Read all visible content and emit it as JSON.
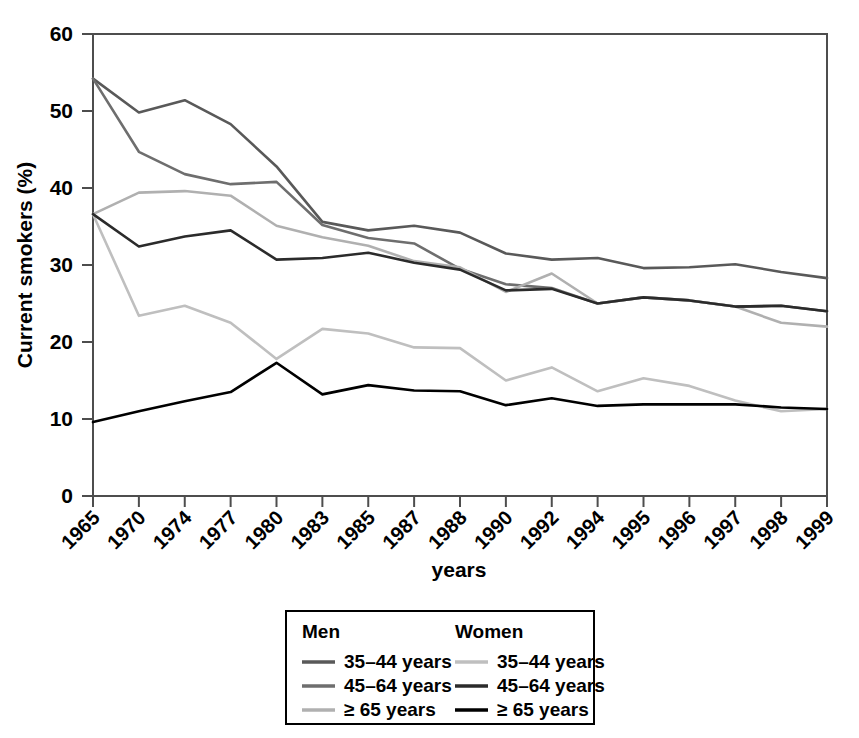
{
  "chart_data": {
    "type": "line",
    "title": "",
    "xlabel": "years",
    "ylabel": "Current smokers (%)",
    "ylim": [
      0,
      60
    ],
    "yticks": [
      0,
      10,
      20,
      30,
      40,
      50,
      60
    ],
    "ytick_labels": [
      "0",
      "10",
      "20",
      "30",
      "40",
      "50",
      "60"
    ],
    "grid": false,
    "legend_position": "below-center",
    "categories": [
      "1965",
      "1970",
      "1974",
      "1977",
      "1980",
      "1983",
      "1985",
      "1987",
      "1988",
      "1990",
      "1992",
      "1994",
      "1995",
      "1996",
      "1997",
      "1998",
      "1999"
    ],
    "series": [
      {
        "name": "Men 35–44 years",
        "group": "Men",
        "age": "35–44 years",
        "color": "#595959",
        "values": [
          54.2,
          49.8,
          51.4,
          48.3,
          42.8,
          35.6,
          34.5,
          35.1,
          34.2,
          31.5,
          30.7,
          30.9,
          29.6,
          29.7,
          30.1,
          29.1,
          28.3
        ]
      },
      {
        "name": "Men 45–64 years",
        "group": "Men",
        "age": "45–64 years",
        "color": "#6e6e6e",
        "values": [
          54.2,
          44.7,
          41.8,
          40.5,
          40.8,
          35.2,
          33.5,
          32.8,
          29.5,
          27.5,
          27.0,
          25.0,
          25.8,
          25.4,
          24.6,
          24.7,
          24.0
        ]
      },
      {
        "name": "Men ≥ 65 years",
        "group": "Men",
        "age": "≥ 65 years",
        "color": "#b0b0b0",
        "values": [
          36.6,
          39.4,
          39.6,
          39.0,
          35.1,
          33.6,
          32.5,
          30.5,
          29.7,
          26.5,
          28.9,
          25.0,
          25.8,
          25.4,
          24.6,
          22.5,
          22.0
        ]
      },
      {
        "name": "Women 35–44 years",
        "group": "Women",
        "age": "35–44 years",
        "color": "#bfbfbf",
        "values": [
          36.6,
          23.4,
          24.7,
          22.5,
          17.8,
          21.7,
          21.1,
          19.3,
          19.2,
          15.0,
          16.7,
          13.6,
          15.3,
          14.3,
          12.4,
          11.0,
          11.3
        ]
      },
      {
        "name": "Women 45–64 years",
        "group": "Women",
        "age": "45–64 years",
        "color": "#2b2b2b",
        "values": [
          36.6,
          32.4,
          33.7,
          34.5,
          30.7,
          30.9,
          31.6,
          30.3,
          29.4,
          26.7,
          26.9,
          25.0,
          25.8,
          25.4,
          24.6,
          24.7,
          24.0
        ]
      },
      {
        "name": "Women ≥ 65 years",
        "group": "Women",
        "age": "≥ 65 years",
        "color": "#000000",
        "values": [
          9.6,
          11.0,
          12.3,
          13.5,
          17.3,
          13.2,
          14.4,
          13.7,
          13.6,
          11.8,
          12.7,
          11.7,
          11.9,
          11.9,
          11.9,
          11.5,
          11.3
        ]
      }
    ]
  },
  "legend": {
    "columns": [
      {
        "heading": "Men",
        "entries": [
          {
            "label": "35–44 years",
            "color": "#595959"
          },
          {
            "label": "45–64 years",
            "color": "#6e6e6e"
          },
          {
            "label": "≥ 65 years",
            "color": "#b0b0b0"
          }
        ]
      },
      {
        "heading": "Women",
        "entries": [
          {
            "label": "35–44 years",
            "color": "#bfbfbf"
          },
          {
            "label": "45–64 years",
            "color": "#2b2b2b"
          },
          {
            "label": "≥ 65 years",
            "color": "#000000"
          }
        ]
      }
    ]
  },
  "colors": {
    "axis": "#4d4d4d",
    "text": "#000000",
    "background": "#ffffff",
    "legend_border": "#000000"
  }
}
